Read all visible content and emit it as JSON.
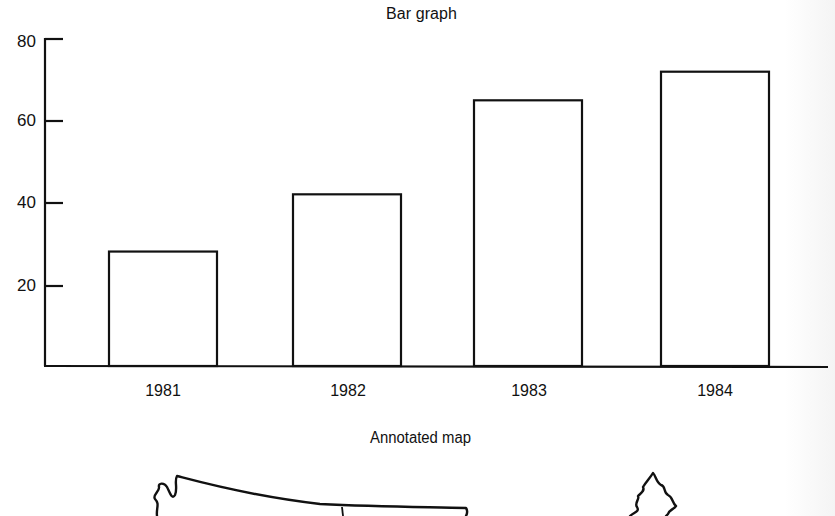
{
  "chart_data": {
    "type": "bar",
    "title": "Bar graph",
    "categories": [
      "1981",
      "1982",
      "1983",
      "1984"
    ],
    "values": [
      28,
      42,
      65,
      72
    ],
    "xlabel": "",
    "ylabel": "",
    "ylim": [
      0,
      80
    ],
    "yticks": [
      20,
      40,
      60,
      80
    ],
    "grid": false,
    "legend": null,
    "bar_style": "unfilled outline"
  },
  "chart": {
    "title": "Bar graph",
    "y_ticks": [
      "80",
      "60",
      "40",
      "20"
    ],
    "x_ticks": [
      "1981",
      "1982",
      "1983",
      "1984"
    ]
  },
  "map": {
    "title": "Annotated map"
  },
  "colors": {
    "ink": "#111111",
    "background": "#ffffff"
  }
}
